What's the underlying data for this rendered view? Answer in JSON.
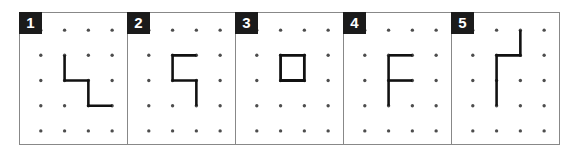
{
  "figure": {
    "name": "dot-grid-pattern-sequence",
    "panel_count": 5,
    "grid": {
      "columns": 4,
      "rows": 5,
      "dot_color": "#4d4d4d",
      "stroke_color": "#111111",
      "frame_color": "#888888",
      "badge_background": "#1b1b1b",
      "badge_text_color": "#ffffff",
      "background": "#ffffff"
    }
  },
  "panels": [
    {
      "number": "1",
      "label": "1",
      "shape_kind": "polyline",
      "description": "descending zigzag: down, right, down, right",
      "points": [
        [
          2,
          2
        ],
        [
          2,
          3
        ],
        [
          3,
          3
        ],
        [
          3,
          4
        ],
        [
          4,
          4
        ]
      ]
    },
    {
      "number": "2",
      "label": "2",
      "shape_kind": "polyline",
      "description": "S-like figure: left, down, right, down",
      "points": [
        [
          3,
          2
        ],
        [
          2,
          2
        ],
        [
          2,
          3
        ],
        [
          3,
          3
        ],
        [
          3,
          4
        ]
      ]
    },
    {
      "number": "3",
      "label": "3",
      "shape_kind": "closed-rectangle",
      "description": "closed square spanning one grid cell",
      "points": [
        [
          2,
          2
        ],
        [
          3,
          2
        ],
        [
          3,
          3
        ],
        [
          2,
          3
        ],
        [
          2,
          2
        ]
      ]
    },
    {
      "number": "4",
      "label": "4",
      "shape_kind": "multi-stroke",
      "description": "letter F: vertical spine with top and middle arms",
      "strokes": [
        [
          [
            2,
            2
          ],
          [
            2,
            4
          ]
        ],
        [
          [
            2,
            2
          ],
          [
            3,
            2
          ]
        ],
        [
          [
            2,
            3
          ],
          [
            3,
            3
          ]
        ]
      ]
    },
    {
      "number": "5",
      "label": "5",
      "shape_kind": "polyline",
      "description": "down, left, then long down stroke",
      "points": [
        [
          3,
          1
        ],
        [
          3,
          2
        ],
        [
          2,
          2
        ],
        [
          2,
          4
        ]
      ]
    }
  ]
}
